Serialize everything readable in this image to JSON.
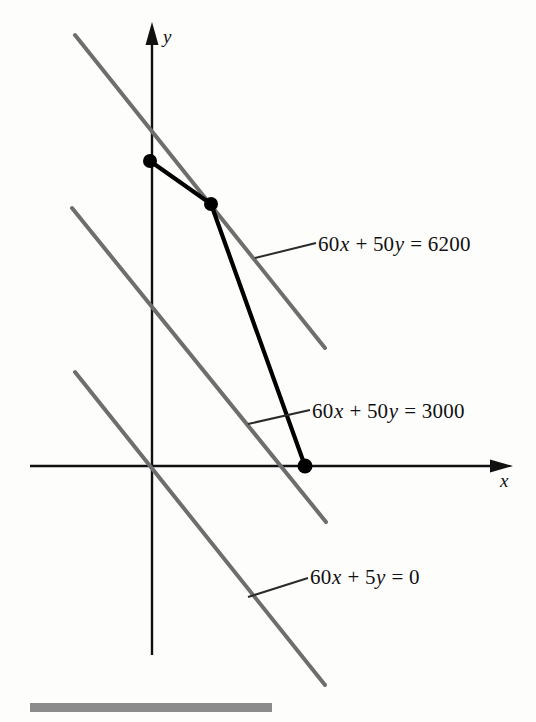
{
  "figure": {
    "kind": "linear-programming-graph",
    "background_color": "#fdfdfc"
  },
  "axes": {
    "x_label": "x",
    "y_label": "y",
    "axis_color": "#111111",
    "origin_px": [
      152,
      466
    ]
  },
  "labels": {
    "line_6200": {
      "coef_x": "60",
      "var_x": "x",
      "plus": "+",
      "coef_y": "50",
      "var_y": "y",
      "eq": "=",
      "rhs": "6200",
      "full": "60x + 50y = 6200"
    },
    "line_3000": {
      "coef_x": "60",
      "var_x": "x",
      "plus": "+",
      "coef_y": "50",
      "var_y": "y",
      "eq": "=",
      "rhs": "3000",
      "full": "60x + 50y = 3000"
    },
    "line_0": {
      "coef_x": "60",
      "var_x": "x",
      "plus": "+",
      "coef_y": "5",
      "var_y": "y",
      "eq": "=",
      "rhs": "0",
      "full": "60x + 5y = 0"
    }
  },
  "colors": {
    "objective_line": "#6e6e6e",
    "constraint_boundary": "#000000",
    "vertex_dot": "#000000",
    "leader_line": "#2b2b2b",
    "bottom_rule": "#8b8b8b"
  },
  "chart_data": {
    "type": "line",
    "title": "",
    "xlabel": "x",
    "ylabel": "y",
    "grid": false,
    "legend": "none",
    "xlim": [
      -40,
      300
    ],
    "ylim": [
      -120,
      270
    ],
    "objective_lines": [
      {
        "name": "60x + 50y = 6200",
        "equation": "60x + 50y = 6200",
        "a": 60,
        "b": 50,
        "c": 6200,
        "slope": -1.2,
        "color": "#6e6e6e",
        "px_start": [
          75,
          35
        ],
        "px_end": [
          325,
          348
        ]
      },
      {
        "name": "60x + 50y = 3000",
        "equation": "60x + 50y = 3000",
        "a": 60,
        "b": 50,
        "c": 3000,
        "slope": -1.2,
        "color": "#6e6e6e",
        "px_start": [
          72,
          208
        ],
        "px_end": [
          326,
          522
        ]
      },
      {
        "name": "60x + 5y = 0",
        "equation": "60x + 5y = 0",
        "a": 60,
        "b": 5,
        "c": 0,
        "slope": -1.2,
        "color": "#6e6e6e",
        "px_start": [
          75,
          372
        ],
        "px_end": [
          325,
          685
        ]
      }
    ],
    "feasible_boundary": {
      "name": "feasible region boundary",
      "color": "#000000",
      "px_points": [
        [
          150,
          161
        ],
        [
          211,
          204
        ],
        [
          305,
          466
        ]
      ]
    },
    "vertices": [
      {
        "name": "vertex-a",
        "px": [
          150,
          161
        ]
      },
      {
        "name": "vertex-b",
        "px": [
          211,
          204
        ]
      },
      {
        "name": "vertex-c",
        "px": [
          305,
          466
        ]
      }
    ],
    "leader_lines": [
      {
        "for": "60x + 50y = 6200",
        "px_start": [
          255,
          258
        ],
        "px_end": [
          316,
          243
        ]
      },
      {
        "for": "60x + 50y = 3000",
        "px_start": [
          248,
          424
        ],
        "px_end": [
          310,
          410
        ]
      },
      {
        "for": "60x + 5y = 0",
        "px_start": [
          248,
          597
        ],
        "px_end": [
          308,
          578
        ]
      }
    ]
  }
}
